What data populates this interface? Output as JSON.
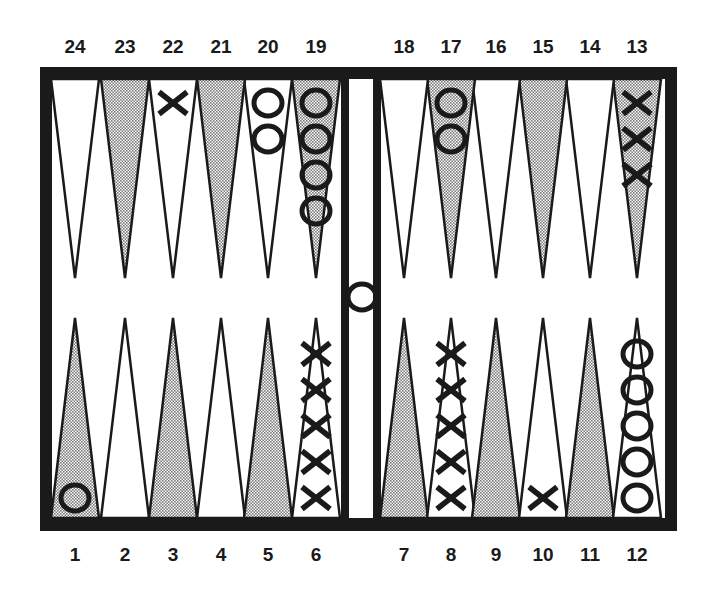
{
  "board": {
    "frame_color": "#1a1a1a",
    "shaded_fill": "#c8c8c8",
    "light_fill": "#ffffff"
  },
  "top_labels": [
    "24",
    "23",
    "22",
    "21",
    "20",
    "19",
    "18",
    "17",
    "16",
    "15",
    "14",
    "13"
  ],
  "bottom_labels": [
    "1",
    "2",
    "3",
    "4",
    "5",
    "6",
    "7",
    "8",
    "9",
    "10",
    "11",
    "12"
  ],
  "points": [
    {
      "point": 1,
      "shaded": true,
      "checker": "O",
      "count": 1
    },
    {
      "point": 2,
      "shaded": false,
      "checker": "",
      "count": 0
    },
    {
      "point": 3,
      "shaded": true,
      "checker": "",
      "count": 0
    },
    {
      "point": 4,
      "shaded": false,
      "checker": "",
      "count": 0
    },
    {
      "point": 5,
      "shaded": true,
      "checker": "",
      "count": 0
    },
    {
      "point": 6,
      "shaded": false,
      "checker": "X",
      "count": 5
    },
    {
      "point": 7,
      "shaded": true,
      "checker": "",
      "count": 0
    },
    {
      "point": 8,
      "shaded": false,
      "checker": "X",
      "count": 5
    },
    {
      "point": 9,
      "shaded": true,
      "checker": "",
      "count": 0
    },
    {
      "point": 10,
      "shaded": false,
      "checker": "X",
      "count": 1
    },
    {
      "point": 11,
      "shaded": true,
      "checker": "",
      "count": 0
    },
    {
      "point": 12,
      "shaded": false,
      "checker": "O",
      "count": 5
    },
    {
      "point": 13,
      "shaded": true,
      "checker": "X",
      "count": 3
    },
    {
      "point": 14,
      "shaded": false,
      "checker": "",
      "count": 0
    },
    {
      "point": 15,
      "shaded": true,
      "checker": "",
      "count": 0
    },
    {
      "point": 16,
      "shaded": false,
      "checker": "",
      "count": 0
    },
    {
      "point": 17,
      "shaded": true,
      "checker": "O",
      "count": 2
    },
    {
      "point": 18,
      "shaded": false,
      "checker": "",
      "count": 0
    },
    {
      "point": 19,
      "shaded": true,
      "checker": "O",
      "count": 4
    },
    {
      "point": 20,
      "shaded": false,
      "checker": "O",
      "count": 2
    },
    {
      "point": 21,
      "shaded": true,
      "checker": "",
      "count": 0
    },
    {
      "point": 22,
      "shaded": false,
      "checker": "X",
      "count": 1
    },
    {
      "point": 23,
      "shaded": true,
      "checker": "",
      "count": 0
    },
    {
      "point": 24,
      "shaded": false,
      "checker": "",
      "count": 0
    }
  ],
  "bar": {
    "checker": "O",
    "count": 1
  }
}
